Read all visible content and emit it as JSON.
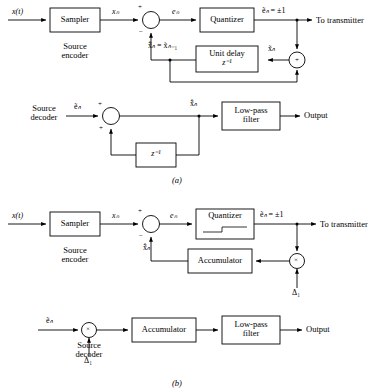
{
  "figure": {
    "type": "block-diagram",
    "captions": {
      "a": "(a)",
      "b": "(b)"
    }
  },
  "panel_a": {
    "caption": "(a)",
    "encoder": {
      "section_label_line1": "Source",
      "section_label_line2": "encoder",
      "input_signal": "x(t)",
      "blocks": [
        {
          "name": "sampler",
          "label": "Sampler"
        },
        {
          "name": "quantizer",
          "label": "Quantizer"
        },
        {
          "name": "unit-delay",
          "label_line1": "Unit delay",
          "label_line2": "z⁻¹"
        }
      ],
      "signals": {
        "sampled": "xₙ",
        "error": "eₙ",
        "transmitted": "ẽₙ = ±1",
        "feedback": "x̃̂ₙ = x̃ₙ₋₁",
        "reconstructed": "x̃ₙ"
      },
      "summing_signs": {
        "top": "+",
        "bottom": "−"
      },
      "adder_sign": "+",
      "output_text": "To transmitter"
    },
    "decoder": {
      "section_label_line1": "Source",
      "section_label_line2": "decoder",
      "blocks": [
        {
          "name": "unit-delay",
          "label": "z⁻¹"
        },
        {
          "name": "low-pass-filter",
          "label_line1": "Low-pass",
          "label_line2": "filter"
        }
      ],
      "signals": {
        "input": "ẽₙ",
        "reconstructed": "x̃̂ₙ"
      },
      "summing_signs": {
        "top": "+",
        "bottom": "+"
      },
      "output_text": "Output"
    }
  },
  "panel_b": {
    "caption": "(b)",
    "encoder": {
      "section_label_line1": "Source",
      "section_label_line2": "encoder",
      "input_signal": "x(t)",
      "blocks": [
        {
          "name": "sampler",
          "label": "Sampler"
        },
        {
          "name": "quantizer",
          "label": "Quantizer"
        },
        {
          "name": "accumulator",
          "label": "Accumulator"
        }
      ],
      "signals": {
        "sampled": "xₙ",
        "error": "eₙ",
        "transmitted": "ẽₙ = ±1",
        "feedback": "x̃̂ₙ",
        "step_size": "Δ₁"
      },
      "summing_signs": {
        "top": "+",
        "bottom": "−"
      },
      "multiplier_symbol": "×",
      "output_text": "To transmitter"
    },
    "decoder": {
      "section_label_line1": "Source",
      "section_label_line2": "decoder",
      "blocks": [
        {
          "name": "accumulator",
          "label": "Accumulator"
        },
        {
          "name": "low-pass-filter",
          "label_line1": "Low-pass",
          "label_line2": "filter"
        }
      ],
      "signals": {
        "input": "ẽₙ",
        "step_size": "Δ₁"
      },
      "multiplier_symbol": "×",
      "output_text": "Output"
    }
  },
  "colors": {
    "line": "#000000",
    "background": "#ffffff"
  }
}
